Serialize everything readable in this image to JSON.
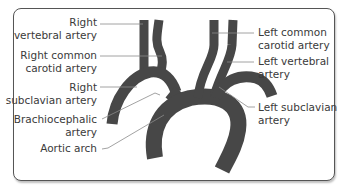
{
  "diagram": {
    "type": "anatomical",
    "vessel_color": "#454545",
    "leader_color": "#8a8a8a",
    "labels": {
      "right_vertebral": [
        "Right",
        "vertebral artery"
      ],
      "right_common_carotid": [
        "Right common",
        "carotid artery"
      ],
      "right_subclavian": [
        "Right",
        "subclavian artery"
      ],
      "brachiocephalic": [
        "Brachiocephalic",
        "artery"
      ],
      "aortic_arch": [
        "Aortic arch"
      ],
      "left_common_carotid": [
        "Left common",
        "carotid artery"
      ],
      "left_vertebral": [
        "Left vertebral",
        "artery"
      ],
      "left_subclavian": [
        "Left subclavian",
        "artery"
      ]
    }
  }
}
